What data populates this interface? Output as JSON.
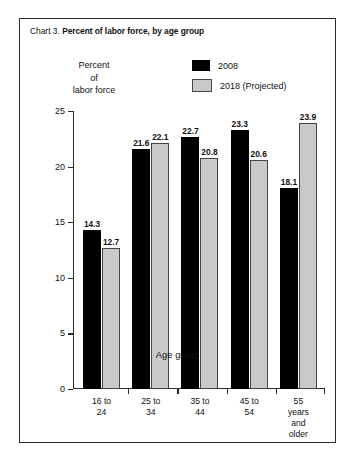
{
  "figure": {
    "title_prefix": "Chart 3.",
    "title_main": "Percent of labor force, by age group"
  },
  "axis_caption": {
    "y_line1": "Percent",
    "y_line2": "of",
    "y_line3": "labor force",
    "x_title": "Age group"
  },
  "legend": {
    "items": [
      {
        "label": "2008",
        "color": "#000000"
      },
      {
        "label": "2018 (Projected)",
        "color": "#c9c9c9"
      }
    ]
  },
  "y_ticks": [
    "0",
    "5",
    "10",
    "15",
    "20",
    "25"
  ],
  "chart_data": {
    "type": "bar",
    "title": "Chart 3. Percent of labor force, by age group",
    "xlabel": "Age group",
    "ylabel": "Percent of labor force",
    "ylim": [
      0,
      25
    ],
    "ytick_step": 5,
    "grid": false,
    "legend_position": "top-right",
    "categories": [
      "16 to 24",
      "25 to 34",
      "35 to 44",
      "45 to 54",
      "55 years\nand older"
    ],
    "series": [
      {
        "name": "2008",
        "color": "#000000",
        "values": [
          14.3,
          21.6,
          22.7,
          23.3,
          18.1
        ]
      },
      {
        "name": "2018 (Projected)",
        "color": "#c9c9c9",
        "values": [
          12.7,
          22.1,
          20.8,
          20.6,
          23.9
        ]
      }
    ]
  }
}
